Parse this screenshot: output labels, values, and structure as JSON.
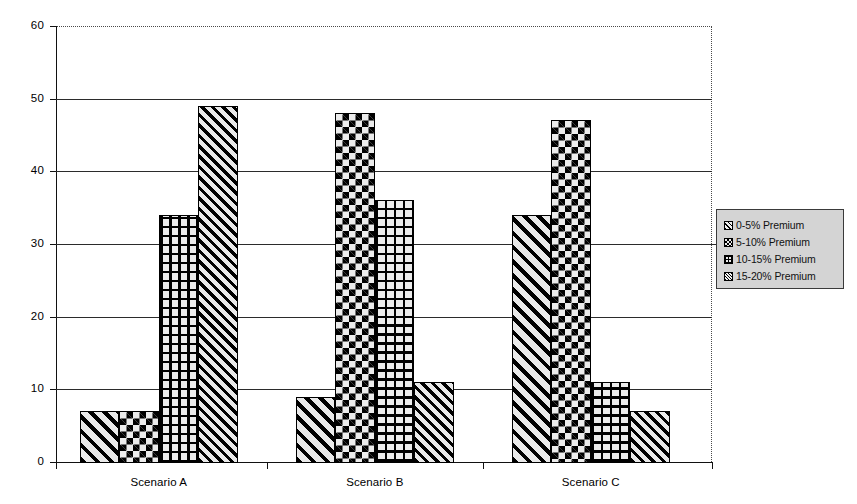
{
  "chart_data": {
    "type": "bar",
    "title": "",
    "subtitle": "",
    "xlabel": "",
    "ylabel": "",
    "categories": [
      "Scenario A",
      "Scenario B",
      "Scenario C"
    ],
    "series": [
      {
        "name": "0-5% Premium",
        "pattern": "diagonal-stripes-wide",
        "values": [
          7,
          9,
          34
        ]
      },
      {
        "name": "5-10% Premium",
        "pattern": "checkerboard",
        "values": [
          7,
          48,
          47
        ]
      },
      {
        "name": "10-15% Premium",
        "pattern": "fine-grid",
        "values": [
          34,
          36,
          11
        ]
      },
      {
        "name": "15-20% Premium",
        "pattern": "diagonal-stripes-dense",
        "values": [
          49,
          11,
          7
        ]
      }
    ],
    "ylim": [
      0,
      60
    ],
    "ytick_values": [
      0,
      10,
      20,
      30,
      40,
      50,
      60
    ],
    "ytick_labels": [
      "0",
      "10",
      "20",
      "30",
      "40",
      "50",
      "60"
    ],
    "grid": true,
    "grid_axis": "y",
    "legend_position": "right",
    "legend_entries": [
      "0-5% Premium",
      "5-10% Premium",
      "10-15% Premium",
      "15-20% Premium"
    ],
    "colors": {
      "bar_outline": "#000000",
      "bar_fill": "#ececec",
      "gridline": "#2b2b2b",
      "axis": "#111111",
      "legend_background": "#d4d4d4",
      "legend_border": "#3a3a3a",
      "plot_background": "#ffffff"
    }
  },
  "axis": {
    "y_labels": [
      "60",
      "50",
      "40",
      "30",
      "20",
      "10",
      "0"
    ]
  },
  "legend": {
    "items": [
      {
        "label": "0-5% Premium"
      },
      {
        "label": "5-10% Premium"
      },
      {
        "label": "10-15% Premium"
      },
      {
        "label": "15-20% Premium"
      }
    ]
  }
}
